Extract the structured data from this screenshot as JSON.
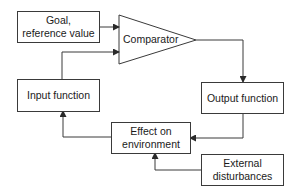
{
  "diagram": {
    "type": "control-loop-block-diagram",
    "nodes": {
      "goal": {
        "line1": "Goal,",
        "line2": "reference value"
      },
      "comparator": {
        "label": "Comparator",
        "shape": "triangle"
      },
      "output": {
        "label": "Output function"
      },
      "input": {
        "label": "Input function"
      },
      "effect": {
        "line1": "Effect on",
        "line2": "environment"
      },
      "external": {
        "line1": "External",
        "line2": "disturbances"
      }
    },
    "edges": [
      {
        "from": "goal",
        "to": "comparator"
      },
      {
        "from": "input",
        "to": "comparator"
      },
      {
        "from": "comparator",
        "to": "output"
      },
      {
        "from": "output",
        "to": "effect"
      },
      {
        "from": "external",
        "to": "effect"
      },
      {
        "from": "effect",
        "to": "input"
      }
    ],
    "colors": {
      "stroke": "#3a3a3a",
      "background": "#ffffff",
      "text": "#1a1a1a"
    }
  }
}
